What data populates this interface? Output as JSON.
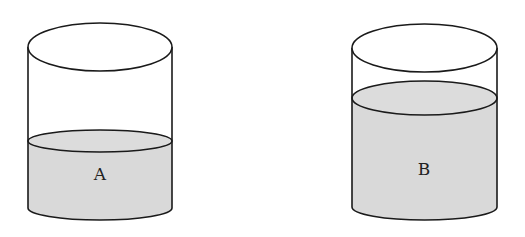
{
  "diagram": {
    "colors": {
      "liquid": "#d9d9d9",
      "outline": "#1a1a1a",
      "background": "#ffffff"
    },
    "containers": [
      {
        "label": "A",
        "fill_level": "low"
      },
      {
        "label": "B",
        "fill_level": "high"
      }
    ]
  }
}
